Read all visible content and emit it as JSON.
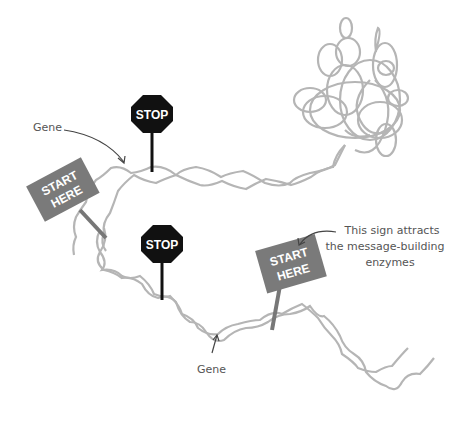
{
  "diagram": {
    "colors": {
      "dna": "#b5b5b5",
      "start_sign": "#7a7a7a",
      "stop_sign": "#111111",
      "annotation": "#555555"
    },
    "signs": [
      {
        "type": "stop",
        "label": "STOP"
      },
      {
        "type": "start",
        "line1": "START",
        "line2": "HERE"
      },
      {
        "type": "stop",
        "label": "STOP"
      },
      {
        "type": "start",
        "line1": "START",
        "line2": "HERE"
      }
    ],
    "annotations": {
      "gene_top": "Gene",
      "gene_bottom": "Gene",
      "start_note": [
        "This sign attracts",
        "the message-building",
        "enzymes"
      ]
    }
  }
}
